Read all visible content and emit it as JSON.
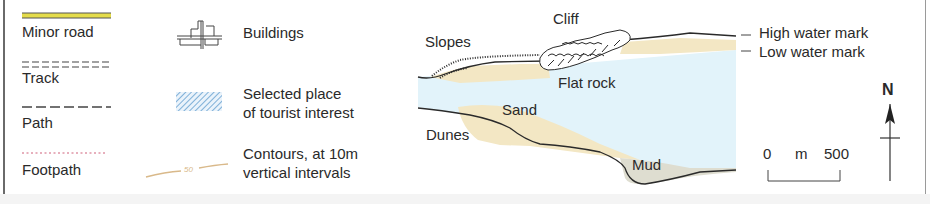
{
  "legend": {
    "left_column": [
      {
        "label": "Minor road",
        "symbol": "minor-road-line",
        "color": "#d8d23a"
      },
      {
        "label": "Track",
        "symbol": "track-double-dash",
        "color": "#444444"
      },
      {
        "label": "Path",
        "symbol": "path-dash",
        "color": "#444444"
      },
      {
        "label": "Footpath",
        "symbol": "footpath-dotted",
        "color": "#d0607a"
      }
    ],
    "middle_column": [
      {
        "label": "Buildings",
        "symbol": "buildings-icon"
      },
      {
        "label_line1": "Selected place",
        "label_line2": "of tourist interest",
        "symbol": "hatched-blue-box",
        "color": "#7fb0d8"
      },
      {
        "label_line1": "Contours, at 10m",
        "label_line2": "vertical intervals",
        "symbol": "contour-line",
        "contour_value": "50",
        "color": "#d9b98a"
      }
    ]
  },
  "diagram": {
    "labels": {
      "cliff": "Cliff",
      "slopes": "Slopes",
      "flat_rock": "Flat rock",
      "sand": "Sand",
      "dunes": "Dunes",
      "mud": "Mud",
      "high_water": "High water mark",
      "low_water": "Low water mark"
    },
    "colors": {
      "water": "#e2f3fa",
      "sand": "#f3e7c4",
      "mud": "#deddd0",
      "outline": "#2a2a2a"
    }
  },
  "scale_bar": {
    "start": "0",
    "unit": "m",
    "end": "500"
  },
  "north_arrow": {
    "label": "N"
  }
}
